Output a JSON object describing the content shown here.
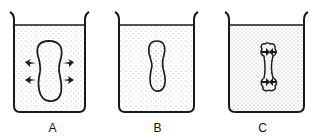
{
  "diagram": {
    "panels": [
      {
        "label": "A",
        "cell_state": "swelling",
        "arrows": "outward"
      },
      {
        "label": "B",
        "cell_state": "normal",
        "arrows": "none"
      },
      {
        "label": "C",
        "cell_state": "shrinking",
        "arrows": "inward"
      }
    ],
    "colors": {
      "line": "#1a1a1a",
      "stipple": "#9a9a9a",
      "background": "#ffffff"
    }
  }
}
